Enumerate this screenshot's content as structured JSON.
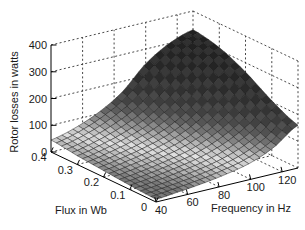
{
  "figure": {
    "background": "#ffffff",
    "border": "none",
    "kind": "matlab-style 3d surface plot"
  },
  "chart_data": {
    "type": "surface",
    "title": "",
    "xlabel": "Frequency in Hz",
    "ylabel": "Flux in Wb",
    "zlabel": "Rotor losses in watts",
    "x_freq_hz": [
      40,
      55,
      70,
      85,
      100,
      115,
      130
    ],
    "y_flux_wb": [
      0,
      0.1,
      0.2,
      0.3,
      0.4
    ],
    "z_rotor_losses_watts": [
      [
        10,
        18,
        28,
        42,
        62,
        100,
        160
      ],
      [
        16,
        26,
        40,
        58,
        88,
        135,
        205
      ],
      [
        24,
        38,
        56,
        82,
        125,
        190,
        265
      ],
      [
        33,
        52,
        78,
        115,
        175,
        255,
        310
      ],
      [
        45,
        68,
        105,
        160,
        245,
        300,
        330
      ]
    ],
    "x_ticks": [
      "40",
      "60",
      "80",
      "100",
      "120"
    ],
    "y_ticks": [
      "0",
      "0.1",
      "0.2",
      "0.3",
      "0.4"
    ],
    "z_ticks": [
      "0",
      "100",
      "200",
      "300",
      "400"
    ],
    "x_range": [
      40,
      130
    ],
    "y_range": [
      0,
      0.4
    ],
    "z_range": [
      0,
      400
    ],
    "grid": true,
    "grid_style": "dashed box walls and floor",
    "legend": "none",
    "colors": {
      "axis_line": "#000000",
      "grid_line": "#333333",
      "mesh_line": "#161616",
      "tick_text": "#1a1a1a",
      "surface_colormap_z_to_gray": [
        [
          0,
          "#646464"
        ],
        [
          20,
          "#7d7d7d"
        ],
        [
          40,
          "#b9b9b9"
        ],
        [
          57,
          "#dadada"
        ],
        [
          70,
          "#c6c6c6"
        ],
        [
          85,
          "#a0a0a0"
        ],
        [
          100,
          "#808080"
        ],
        [
          120,
          "#606060"
        ],
        [
          140,
          "#4c4c4c"
        ],
        [
          170,
          "#3e3e3e"
        ],
        [
          210,
          "#343434"
        ],
        [
          260,
          "#2d2d2d"
        ],
        [
          320,
          "#282828"
        ],
        [
          400,
          "#232323"
        ]
      ]
    }
  }
}
